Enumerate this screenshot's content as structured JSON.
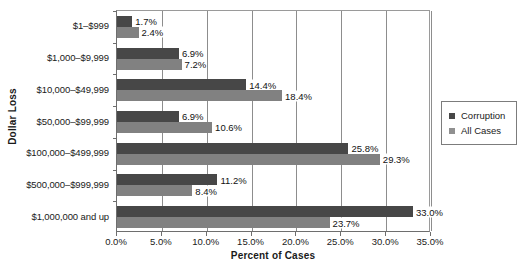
{
  "chart_data": {
    "type": "bar",
    "orientation": "horizontal",
    "title": "",
    "xlabel": "Percent of Cases",
    "ylabel": "Dollar Loss",
    "categories": [
      "$1–$999",
      "$1,000–$9,999",
      "$10,000–$49,999",
      "$50,000–$99,999",
      "$100,000–$499,999",
      "$500,000–$999,999",
      "$1,000,000 and up"
    ],
    "series": [
      {
        "name": "Corruption",
        "color": "#474747",
        "values": [
          1.7,
          6.9,
          14.4,
          6.9,
          25.8,
          11.2,
          33.0
        ],
        "labels": [
          "1.7%",
          "6.9%",
          "14.4%",
          "6.9%",
          "25.8%",
          "11.2%",
          "33.0%"
        ]
      },
      {
        "name": "All Cases",
        "color": "#818181",
        "values": [
          2.4,
          7.2,
          18.4,
          10.6,
          29.3,
          8.4,
          23.7
        ],
        "labels": [
          "2.4%",
          "7.2%",
          "18.4%",
          "10.6%",
          "29.3%",
          "8.4%",
          "23.7%"
        ]
      }
    ],
    "xlim": [
      0,
      35
    ],
    "xticks": [
      0,
      5,
      10,
      15,
      20,
      25,
      30,
      35
    ],
    "xtick_labels": [
      "0.0%",
      "5.0%",
      "10.0%",
      "15.0%",
      "20.0%",
      "25.0%",
      "30.0%",
      "35.0%"
    ],
    "grid": "vertical",
    "legend_position": "right"
  },
  "legend": {
    "items": [
      {
        "label": "Corruption"
      },
      {
        "label": "All Cases"
      }
    ]
  }
}
